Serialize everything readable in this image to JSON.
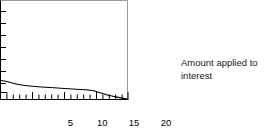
{
  "problem": {
    "number": "89."
  },
  "annotation": {
    "line1": "Amount applied to",
    "line2": "interest"
  },
  "colors": {
    "frame": "#9a9a9a",
    "curve": "#000000",
    "axis": "#000000",
    "text": "#000000",
    "background": "#ffffff"
  },
  "chart_data": {
    "type": "line",
    "title": "",
    "subtitle": "",
    "xlabel": "",
    "ylabel": "",
    "annotations": [
      "Amount applied to interest"
    ],
    "grid": false,
    "legend": null,
    "xlim": [
      0,
      20
    ],
    "ylim": [
      0,
      10
    ],
    "x_ticks_major": [
      5,
      10,
      15,
      20
    ],
    "x_tick_labels": [
      "5",
      "10",
      "15",
      "20"
    ],
    "x_ticks_minor": [
      1,
      2,
      3,
      4,
      6,
      7,
      8,
      9,
      11,
      12,
      13,
      14,
      16,
      17,
      18,
      19
    ],
    "y_ticks_major": [
      1,
      2,
      3,
      4,
      5,
      6,
      7,
      8
    ],
    "y_tick_labels": [],
    "series": [
      {
        "name": "Amount applied to interest",
        "x": [
          0,
          1,
          2,
          3,
          4,
          5,
          6,
          7,
          8,
          9,
          10,
          11,
          12,
          13,
          14,
          15,
          16,
          17,
          18,
          19,
          20
        ],
        "values": [
          2.0,
          1.85,
          1.75,
          1.68,
          1.62,
          1.58,
          1.54,
          1.5,
          1.46,
          1.43,
          1.4,
          1.36,
          1.32,
          1.27,
          1.2,
          1.12,
          0.98,
          0.8,
          0.6,
          0.36,
          0.1
        ]
      }
    ]
  }
}
